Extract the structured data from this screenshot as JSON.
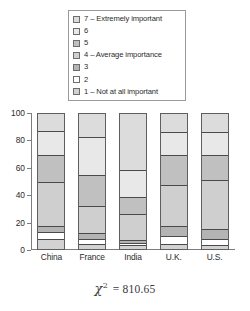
{
  "legend": {
    "position": "top-center",
    "items": [
      {
        "label": "7 – Extremely important",
        "key": "7",
        "color": "#dcdcdc"
      },
      {
        "label": "6",
        "key": "6",
        "color": "#e8e8e8"
      },
      {
        "label": "5",
        "key": "5",
        "color": "#c0c0c0"
      },
      {
        "label": "4 – Average importance",
        "key": "4",
        "color": "#cfcfcf"
      },
      {
        "label": "3",
        "key": "3",
        "color": "#b4b4b4"
      },
      {
        "label": "2",
        "key": "2",
        "color": "#ffffff"
      },
      {
        "label": "1 – Not at all important",
        "key": "1",
        "color": "#d2d2d2"
      }
    ]
  },
  "axes": {
    "y_ticks": [
      "100",
      "80",
      "60",
      "40",
      "20",
      "0"
    ],
    "x_labels": [
      "China",
      "France",
      "India",
      "U.K.",
      "U.S."
    ]
  },
  "caption": {
    "symbol": "χ",
    "exponent": "2",
    "equals_value": "= 810.65",
    "full_text": "χ² = 810.65"
  },
  "chart_data": {
    "type": "bar",
    "variant": "stacked-percent",
    "title": "",
    "subtitle": "",
    "xlabel": "",
    "ylabel": "",
    "ylim": [
      0,
      100
    ],
    "grid": false,
    "legend_position": "top-center",
    "annotations": [
      "χ² = 810.65"
    ],
    "categories": [
      "China",
      "France",
      "India",
      "U.K.",
      "U.S."
    ],
    "tick_labels": {
      "y": [
        "0",
        "20",
        "40",
        "60",
        "80",
        "100"
      ],
      "x": [
        "China",
        "France",
        "India",
        "U.K.",
        "U.S."
      ]
    },
    "series": [
      {
        "name": "7 – Extremely important",
        "color": "#dcdcdc",
        "values": [
          13,
          18,
          42,
          14,
          14
        ]
      },
      {
        "name": "6",
        "color": "#e8e8e8",
        "values": [
          18,
          28,
          20,
          17,
          17
        ]
      },
      {
        "name": "5",
        "color": "#c0c0c0",
        "values": [
          20,
          23,
          13,
          22,
          19
        ]
      },
      {
        "name": "4 – Average importance",
        "color": "#cfcfcf",
        "values": [
          33,
          20,
          19,
          31,
          36
        ]
      },
      {
        "name": "3",
        "color": "#b4b4b4",
        "values": [
          4,
          4,
          2,
          7,
          7
        ]
      },
      {
        "name": "2",
        "color": "#ffffff",
        "values": [
          5,
          4,
          2,
          6,
          5
        ]
      },
      {
        "name": "1 – Not at all important",
        "color": "#d2d2d2",
        "values": [
          7,
          3,
          2,
          3,
          2
        ]
      }
    ]
  }
}
